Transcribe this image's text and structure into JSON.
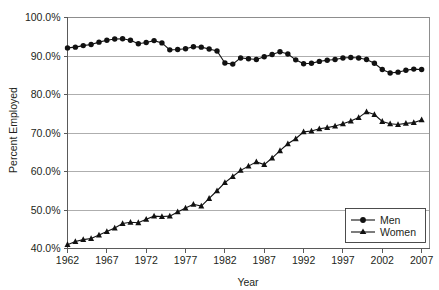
{
  "chart_data": {
    "type": "line",
    "title": "",
    "xlabel": "Year",
    "ylabel": "Percent Employed",
    "xlim": [
      1962,
      2008
    ],
    "ylim": [
      40,
      100
    ],
    "ytick_labels": [
      "100.0%",
      "90.0%",
      "80.0%",
      "70.0%",
      "60.0%",
      "50.0%",
      "40.0%"
    ],
    "ytick_values": [
      100,
      90,
      80,
      70,
      60,
      50,
      40
    ],
    "xtick_labels": [
      "1962",
      "1967",
      "1972",
      "1977",
      "1982",
      "1987",
      "1992",
      "1997",
      "2002",
      "2007"
    ],
    "xtick_values": [
      1962,
      1967,
      1972,
      1977,
      1982,
      1987,
      1992,
      1997,
      2002,
      2007
    ],
    "grid": "horizontal",
    "legend_position": "bottom-right",
    "x": [
      1962,
      1963,
      1964,
      1965,
      1966,
      1967,
      1968,
      1969,
      1970,
      1971,
      1972,
      1973,
      1974,
      1975,
      1976,
      1977,
      1978,
      1979,
      1980,
      1981,
      1982,
      1983,
      1984,
      1985,
      1986,
      1987,
      1988,
      1989,
      1990,
      1991,
      1992,
      1993,
      1994,
      1995,
      1996,
      1997,
      1998,
      1999,
      2000,
      2001,
      2002,
      2003,
      2004,
      2005,
      2006,
      2007
    ],
    "series": [
      {
        "name": "Men",
        "marker": "circle",
        "color": "#111111",
        "values": [
          92.1,
          92.3,
          92.7,
          93.0,
          93.6,
          94.1,
          94.4,
          94.5,
          94.1,
          93.2,
          93.5,
          94.0,
          93.4,
          91.6,
          91.7,
          91.9,
          92.4,
          92.3,
          91.8,
          91.3,
          88.2,
          87.9,
          89.5,
          89.3,
          89.1,
          89.8,
          90.4,
          91.1,
          90.5,
          89.0,
          88.0,
          88.1,
          88.6,
          88.9,
          89.1,
          89.5,
          89.6,
          89.5,
          89.1,
          88.1,
          86.5,
          85.6,
          85.8,
          86.3,
          86.6,
          86.5
        ]
      },
      {
        "name": "Women",
        "marker": "triangle",
        "color": "#111111",
        "values": [
          41.0,
          41.8,
          42.3,
          42.6,
          43.5,
          44.4,
          45.3,
          46.5,
          46.8,
          46.7,
          47.6,
          48.4,
          48.3,
          48.4,
          49.5,
          50.5,
          51.5,
          51.0,
          53.0,
          55.0,
          57.1,
          58.7,
          60.3,
          61.4,
          62.5,
          61.8,
          63.5,
          65.4,
          67.2,
          68.5,
          70.3,
          70.5,
          71.1,
          71.4,
          71.8,
          72.4,
          73.1,
          74.0,
          75.5,
          74.8,
          73.0,
          72.4,
          72.2,
          72.5,
          72.7,
          73.4
        ]
      }
    ]
  },
  "legend": {
    "items": [
      {
        "label": "Men"
      },
      {
        "label": "Women"
      }
    ]
  }
}
